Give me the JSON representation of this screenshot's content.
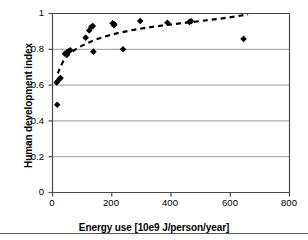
{
  "figure": {
    "caption_rule": true
  },
  "chart_data": {
    "type": "scatter",
    "title": "",
    "xlabel": "Energy use [10e9 J/person/year]",
    "ylabel": "Human development index",
    "xlim": [
      0,
      800
    ],
    "ylim": [
      0,
      1
    ],
    "xticks": [
      0,
      200,
      400,
      600,
      800
    ],
    "xtick_labels": [
      "0",
      "200",
      "400",
      "600",
      "800"
    ],
    "yticks": [
      0,
      0.2,
      0.4,
      0.6,
      0.8,
      1
    ],
    "ytick_labels": [
      "0",
      "0.2",
      "0.4",
      "0.6",
      "0.8",
      "1"
    ],
    "grid": "horizontal",
    "legend": "none",
    "marker": "filled-diamond",
    "marker_color": "#000000",
    "points": [
      {
        "x": 14,
        "y": 0.615
      },
      {
        "x": 16,
        "y": 0.49
      },
      {
        "x": 24,
        "y": 0.635
      },
      {
        "x": 27,
        "y": 0.64
      },
      {
        "x": 42,
        "y": 0.775
      },
      {
        "x": 50,
        "y": 0.785
      },
      {
        "x": 56,
        "y": 0.79
      },
      {
        "x": 60,
        "y": 0.795
      },
      {
        "x": 112,
        "y": 0.865
      },
      {
        "x": 124,
        "y": 0.905
      },
      {
        "x": 131,
        "y": 0.925
      },
      {
        "x": 136,
        "y": 0.93
      },
      {
        "x": 138,
        "y": 0.787
      },
      {
        "x": 203,
        "y": 0.945
      },
      {
        "x": 207,
        "y": 0.935
      },
      {
        "x": 209,
        "y": 0.94
      },
      {
        "x": 238,
        "y": 0.8
      },
      {
        "x": 296,
        "y": 0.958
      },
      {
        "x": 388,
        "y": 0.948
      },
      {
        "x": 462,
        "y": 0.953
      },
      {
        "x": 468,
        "y": 0.957
      },
      {
        "x": 645,
        "y": 0.858
      }
    ],
    "trend": {
      "style": "dashed",
      "color": "#000000",
      "description": "logarithmic saturating curve",
      "points": [
        {
          "x": 18,
          "y": 0.665
        },
        {
          "x": 26,
          "y": 0.7
        },
        {
          "x": 36,
          "y": 0.733
        },
        {
          "x": 50,
          "y": 0.762
        },
        {
          "x": 68,
          "y": 0.789
        },
        {
          "x": 90,
          "y": 0.812
        },
        {
          "x": 115,
          "y": 0.833
        },
        {
          "x": 145,
          "y": 0.854
        },
        {
          "x": 180,
          "y": 0.873
        },
        {
          "x": 220,
          "y": 0.89
        },
        {
          "x": 265,
          "y": 0.906
        },
        {
          "x": 315,
          "y": 0.92
        },
        {
          "x": 370,
          "y": 0.933
        },
        {
          "x": 430,
          "y": 0.945
        },
        {
          "x": 495,
          "y": 0.957
        },
        {
          "x": 560,
          "y": 0.97
        },
        {
          "x": 620,
          "y": 0.984
        },
        {
          "x": 660,
          "y": 0.995
        }
      ]
    }
  }
}
